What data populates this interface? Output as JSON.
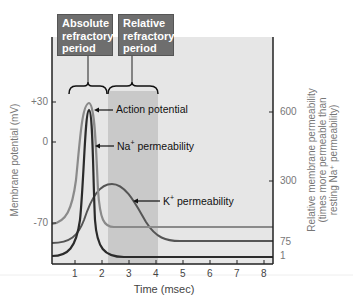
{
  "boxes": {
    "absolute": "Absolute refractory period",
    "relative": "Relative refractory period"
  },
  "labels": {
    "action_potential": "Action potential",
    "na_perm_pre": "Na",
    "na_perm_sup": "+",
    "na_perm_post": " permeability",
    "k_perm_pre": "K",
    "k_perm_sup": "+",
    "k_perm_post": " permeability"
  },
  "axes": {
    "left_title": "Membrane potential (mV)",
    "right_title_1": "Relative membrane permeability",
    "right_title_2": "(times more permeable than",
    "right_title_3": "resting Na⁺ permeability)",
    "x_title": "Time (msec)",
    "left_ticks": [
      "+30",
      "0",
      "-70"
    ],
    "right_ticks": [
      "600",
      "300",
      "75",
      "1"
    ],
    "x_ticks": [
      "1",
      "2",
      "3",
      "4",
      "5",
      "6",
      "7",
      "8"
    ]
  },
  "chart_data": {
    "type": "line",
    "title": "",
    "xlabel": "Time (msec)",
    "ylabel": "Membrane potential (mV)",
    "y2label": "Relative membrane permeability (times more permeable than resting Na+ permeability)",
    "xlim": [
      0.3,
      8.2
    ],
    "x_ticks": [
      1,
      2,
      3,
      4,
      5,
      6,
      7,
      8
    ],
    "y_ticks": [
      30,
      0,
      -70
    ],
    "y2_ticks": [
      600,
      300,
      75,
      1
    ],
    "regions": [
      {
        "name": "Absolute refractory period",
        "x": [
          0.7,
          2.2
        ]
      },
      {
        "name": "Relative refractory period",
        "x": [
          2.2,
          4.0
        ]
      }
    ],
    "series": [
      {
        "name": "Action potential",
        "axis": "left",
        "points": [
          [
            0.3,
            -70
          ],
          [
            1.0,
            -62
          ],
          [
            1.3,
            -30
          ],
          [
            1.55,
            30
          ],
          [
            1.75,
            0
          ],
          [
            1.9,
            -70
          ],
          [
            2.2,
            -72
          ],
          [
            8.2,
            -72
          ]
        ]
      },
      {
        "name": "Na+ permeability",
        "axis": "right",
        "points": [
          [
            0.3,
            1
          ],
          [
            1.0,
            20
          ],
          [
            1.3,
            200
          ],
          [
            1.55,
            560
          ],
          [
            1.75,
            200
          ],
          [
            1.95,
            20
          ],
          [
            2.5,
            1
          ],
          [
            8.2,
            1
          ]
        ]
      },
      {
        "name": "K+ permeability",
        "axis": "right",
        "points": [
          [
            0.3,
            75
          ],
          [
            1.2,
            110
          ],
          [
            1.6,
            250
          ],
          [
            2.2,
            300
          ],
          [
            3.0,
            230
          ],
          [
            3.6,
            110
          ],
          [
            4.5,
            75
          ],
          [
            8.2,
            75
          ]
        ]
      }
    ],
    "grid": false,
    "legend": "inline-annotations"
  },
  "colors": {
    "bg_light": "#e6e6e6",
    "band_dark": "#c9c9c9",
    "box": "#6e6e6e",
    "ap_line": "#8a8a8a",
    "na_line": "#2b2b2b",
    "k_line": "#555555"
  }
}
